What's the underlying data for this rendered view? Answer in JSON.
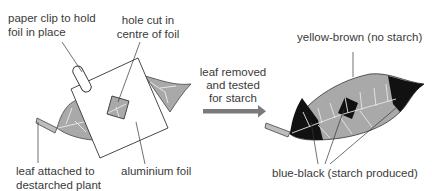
{
  "diagram": {
    "type": "biology-experiment-illustration",
    "colors": {
      "leaf_fill": "#a9a9a9",
      "leaf_vein": "#e6e6e6",
      "starch_black": "#111111",
      "foil_stroke": "#333333",
      "arrow": "#7a7a7a",
      "text": "#3a3a3a"
    },
    "left": {
      "labels": {
        "paper_clip_line1": "paper clip to hold",
        "paper_clip_line2": "foil in place",
        "hole_line1": "hole cut in",
        "hole_line2": "centre of foil",
        "leaf_attached_line1": "leaf attached to",
        "leaf_attached_line2": "destarched plant",
        "foil": "aluminium foil"
      }
    },
    "arrow": {
      "label_line1": "leaf removed",
      "label_line2": "and tested",
      "label_line3": "for starch"
    },
    "right": {
      "labels": {
        "no_starch": "yellow-brown (no starch)",
        "starch": "blue-black (starch produced)"
      }
    }
  }
}
